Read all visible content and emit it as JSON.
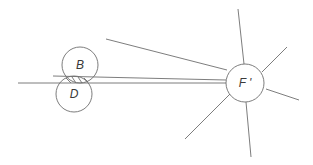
{
  "diagram": {
    "nodes": [
      {
        "id": "B",
        "label": "B",
        "cx": 80,
        "cy": 65,
        "r": 18
      },
      {
        "id": "D",
        "label": "D",
        "cx": 74,
        "cy": 94,
        "r": 18
      },
      {
        "id": "F",
        "label": "F '",
        "cx": 245,
        "cy": 83,
        "r": 19
      }
    ],
    "lines": [
      {
        "x1": 18,
        "y1": 83,
        "x2": 226,
        "y2": 83
      },
      {
        "x1": 53,
        "y1": 76,
        "x2": 226,
        "y2": 80
      },
      {
        "x1": 106,
        "y1": 39,
        "x2": 227,
        "y2": 70
      },
      {
        "x1": 238,
        "y1": 9,
        "x2": 244,
        "y2": 64
      },
      {
        "x1": 262,
        "y1": 72,
        "x2": 287,
        "y2": 47
      },
      {
        "x1": 266,
        "y1": 89,
        "x2": 299,
        "y2": 100
      },
      {
        "x1": 246,
        "y1": 102,
        "x2": 251,
        "y2": 157
      },
      {
        "x1": 185,
        "y1": 139,
        "x2": 230,
        "y2": 94
      }
    ],
    "hatch": [
      {
        "x1": 66,
        "y1": 78,
        "x2": 71,
        "y2": 83
      },
      {
        "x1": 72,
        "y1": 77,
        "x2": 76,
        "y2": 83
      },
      {
        "x1": 78,
        "y1": 77,
        "x2": 82,
        "y2": 83
      },
      {
        "x1": 84,
        "y1": 78,
        "x2": 88,
        "y2": 82
      }
    ]
  }
}
